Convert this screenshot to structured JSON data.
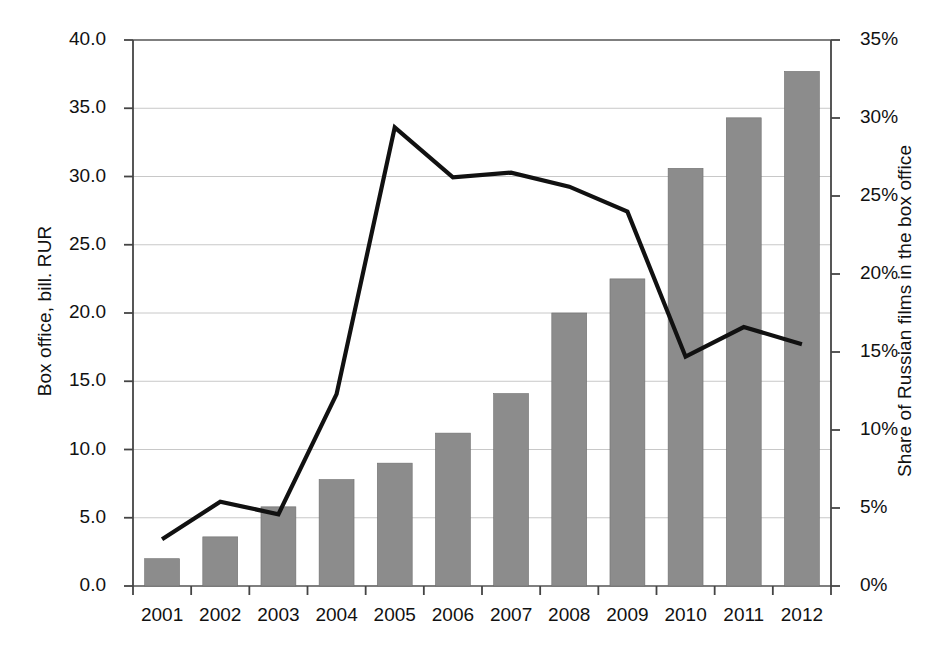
{
  "chart_data": {
    "type": "bar",
    "title": "",
    "subtitle": "",
    "xlabel": "",
    "ylabel": "Box office, bill. RUR",
    "ylabel_right": "Share of Russian films in the box office",
    "categories": [
      "2001",
      "2002",
      "2003",
      "2004",
      "2005",
      "2006",
      "2007",
      "2008",
      "2009",
      "2010",
      "2011",
      "2012"
    ],
    "ylim": [
      0,
      40
    ],
    "ylim_right": [
      0,
      35
    ],
    "grid": true,
    "legend": "none",
    "series": [
      {
        "name": "Box office, bill. RUR",
        "type": "bar",
        "axis": "left",
        "color": "#8c8c8c",
        "values": [
          2.0,
          3.6,
          5.8,
          7.8,
          9.0,
          11.2,
          14.1,
          20.0,
          22.5,
          30.6,
          34.3,
          37.7
        ]
      },
      {
        "name": "Share of Russian films in the box office",
        "type": "line",
        "axis": "right",
        "color": "#111111",
        "values": [
          3.0,
          5.4,
          4.6,
          12.3,
          29.4,
          26.2,
          26.5,
          25.6,
          24.0,
          14.7,
          16.6,
          15.5
        ]
      }
    ],
    "yticks_left": [
      "0.0",
      "5.0",
      "10.0",
      "15.0",
      "20.0",
      "25.0",
      "30.0",
      "35.0",
      "40.0"
    ],
    "yticks_right": [
      "0%",
      "5%",
      "10%",
      "15%",
      "20%",
      "25%",
      "30%",
      "35%"
    ]
  }
}
